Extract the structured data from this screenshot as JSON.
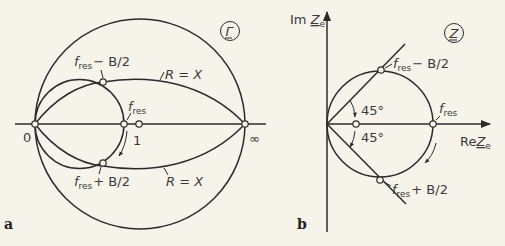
{
  "panels": {
    "a": {
      "panel_label": "a",
      "plane_symbol": "Γ",
      "labels": {
        "origin": "0",
        "infinity": "∞",
        "unit_point": "1",
        "f_base": "f",
        "f_sub": "res",
        "upper_band_suffix": "− B/2",
        "lower_band_suffix": "+ B/2",
        "r_equals_x_upper": "R = X",
        "r_equals_x_lower": "R = X"
      }
    },
    "b": {
      "panel_label": "b",
      "plane_symbol": "Z",
      "labels": {
        "im_axis_prefix": "Im ",
        "im_axis_var": "Z",
        "im_axis_sub": "e",
        "re_axis_prefix": "Re",
        "re_axis_var": "Z",
        "re_axis_sub": "e",
        "angle_upper": "45°",
        "angle_lower": "45°",
        "f_base": "f",
        "f_sub": "res",
        "upper_band_suffix": "− B/2",
        "lower_band_suffix": "+ B/2"
      }
    }
  },
  "colors": {
    "line": "#2b2b2b",
    "background": "#f6f4ea",
    "text": "#3a3a3a"
  }
}
